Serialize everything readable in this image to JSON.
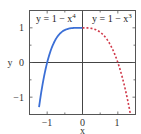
{
  "chart_data": {
    "type": "line",
    "title": "",
    "xlabel": "x",
    "ylabel": "y",
    "xlim": [
      -1.5,
      1.5
    ],
    "ylim": [
      -1.5,
      1.5
    ],
    "grid": false,
    "x_ticks": [
      -1,
      0,
      1
    ],
    "x_tick_labels": [
      "−1",
      "0",
      "1"
    ],
    "y_ticks": [
      -1,
      0,
      1
    ],
    "y_tick_labels": [
      "−1",
      "0",
      "1"
    ],
    "axes_lines_through_origin": true,
    "series": [
      {
        "name": "y = 1 − x⁴",
        "function": "1 - x^4",
        "domain": [
          -1.23,
          0
        ],
        "style": "solid",
        "color": "#3b6fd6",
        "x": [
          -1.23,
          -1.2,
          -1.1,
          -1.0,
          -0.9,
          -0.8,
          -0.7,
          -0.6,
          -0.5,
          -0.4,
          -0.3,
          -0.2,
          -0.1,
          0
        ],
        "values": [
          -1.29,
          -1.07,
          -0.46,
          0.0,
          0.34,
          0.59,
          0.76,
          0.87,
          0.94,
          0.97,
          0.99,
          1.0,
          1.0,
          1.0
        ]
      },
      {
        "name": "y = 1 − x³",
        "function": "1 - x^3",
        "domain": [
          0,
          1.35
        ],
        "style": "dotted",
        "color": "#d0394a",
        "x": [
          0,
          0.1,
          0.2,
          0.3,
          0.4,
          0.5,
          0.6,
          0.7,
          0.8,
          0.9,
          1.0,
          1.1,
          1.2,
          1.3,
          1.35
        ],
        "values": [
          1.0,
          1.0,
          0.99,
          0.97,
          0.94,
          0.88,
          0.78,
          0.66,
          0.49,
          0.27,
          0.0,
          -0.33,
          -0.73,
          -1.2,
          -1.46
        ]
      }
    ],
    "annotations": [
      {
        "text": "y = 1 − x⁴",
        "position": "upper-left quadrant"
      },
      {
        "text": "y = 1 − x³",
        "position": "upper-right quadrant"
      }
    ],
    "legend": null
  },
  "labels": {
    "xlabel": "x",
    "ylabel": "y",
    "xticks": [
      "−1",
      "0",
      "1"
    ],
    "yticks": [
      "1",
      "0",
      "−1"
    ],
    "ann_left_base": "y = 1 − x",
    "ann_left_exp": "4",
    "ann_right_base": "y = 1 − x",
    "ann_right_exp": "3"
  }
}
